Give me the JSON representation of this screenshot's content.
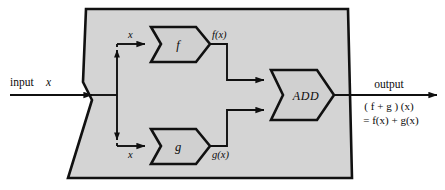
{
  "diagram": {
    "colors": {
      "machine_fill": "#d4d4d4",
      "block_fill": "#d0d0d0",
      "stroke": "#111111",
      "line": "#101010",
      "text": "#0b0b0b",
      "background": "#ffffff"
    },
    "input": {
      "label": "input",
      "variable": "x"
    },
    "split": {
      "top_label": "x",
      "bottom_label": "x"
    },
    "blocks": [
      {
        "id": "f",
        "label": "f",
        "output_label": "f(x)"
      },
      {
        "id": "g",
        "label": "g",
        "output_label": "g(x)"
      },
      {
        "id": "add",
        "label": "ADD",
        "output_label": ""
      }
    ],
    "output": {
      "label": "output",
      "line1": "( f + g ) (x)",
      "line2": "= f(x) + g(x)"
    }
  }
}
